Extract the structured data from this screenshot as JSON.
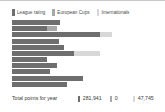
{
  "chart_data": {
    "type": "bar",
    "orientation": "horizontal",
    "stacked": true,
    "title": "",
    "xlabel": "",
    "ylabel": "",
    "grid": false,
    "legend_position": "top-left",
    "xlim": [
      0,
      150
    ],
    "categories": [
      "1",
      "2",
      "3",
      "4",
      "5",
      "6",
      "7",
      "8",
      "9",
      "10",
      "11"
    ],
    "series": [
      {
        "name": "League rating",
        "color": "#6e6e6e",
        "values": [
          48,
          35,
          88,
          47,
          52,
          62,
          35,
          45,
          38,
          71,
          55
        ]
      },
      {
        "name": "European Cups",
        "color": "#a8a8a8",
        "values": [
          0,
          10,
          0,
          0,
          0,
          0,
          0,
          0,
          0,
          0,
          0
        ]
      },
      {
        "name": "Internationals",
        "color": "#d8d8d8",
        "values": [
          0,
          0,
          12,
          0,
          0,
          26,
          0,
          0,
          0,
          0,
          0
        ]
      }
    ],
    "totals_label": "Total points for year",
    "totals": [
      "281,941",
      "0",
      "47,745"
    ]
  },
  "legend": {
    "items": [
      {
        "label": "League rating",
        "color": "#6e6e6e"
      },
      {
        "label": "European Cups",
        "color": "#a8a8a8"
      },
      {
        "label": "Internationals",
        "color": "#d8d8d8"
      }
    ]
  },
  "footer": {
    "label": "Total points for year",
    "totals": [
      {
        "value": "281,941",
        "color": "#6e6e6e"
      },
      {
        "value": "0",
        "color": "#a8a8a8"
      },
      {
        "value": "47,745",
        "color": "#d8d8d8"
      }
    ]
  }
}
